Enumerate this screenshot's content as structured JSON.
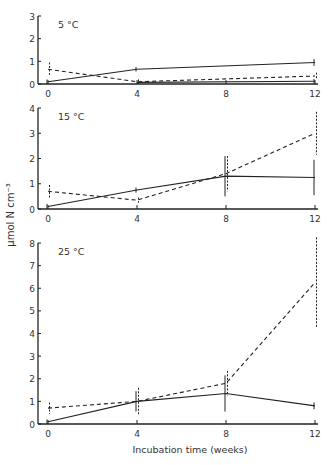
{
  "figure": {
    "ylabel": "µmol N cm⁻³",
    "xlabel": "Incubation time (weeks)"
  },
  "chart_data": [
    {
      "type": "line",
      "title": "5 °C",
      "xlabel": "Incubation time (weeks)",
      "ylabel": "µmol N cm⁻³",
      "x": [
        0,
        4,
        8,
        12
      ],
      "xticks": [
        0,
        4,
        8,
        12
      ],
      "yticks": [
        0,
        1,
        2,
        3
      ],
      "ylim": [
        0,
        3
      ],
      "xlim": [
        0,
        12
      ],
      "series": [
        {
          "name": "solid",
          "style": "solid",
          "x": [
            0,
            4,
            12
          ],
          "values": [
            0.1,
            0.65,
            0.95
          ],
          "err": [
            0.1,
            0.1,
            0.15
          ]
        },
        {
          "name": "dashed",
          "style": "dashed",
          "x": [
            0,
            4,
            12
          ],
          "values": [
            0.65,
            0.1,
            0.35
          ],
          "err": [
            0.3,
            0.1,
            0.15
          ]
        },
        {
          "name": "baseline-solid",
          "style": "solid",
          "x": [
            4,
            12
          ],
          "values": [
            0.07,
            0.12
          ],
          "err": [
            0,
            0.1
          ]
        }
      ]
    },
    {
      "type": "line",
      "title": "15 °C",
      "xlabel": "Incubation time (weeks)",
      "ylabel": "µmol N cm⁻³",
      "x": [
        0,
        4,
        8,
        12
      ],
      "xticks": [
        0,
        4,
        8,
        12
      ],
      "yticks": [
        0,
        1,
        2,
        3,
        4
      ],
      "ylim": [
        0,
        4
      ],
      "xlim": [
        0,
        12
      ],
      "series": [
        {
          "name": "solid",
          "style": "solid",
          "x": [
            0,
            4,
            8,
            12
          ],
          "values": [
            0.1,
            0.75,
            1.3,
            1.25
          ],
          "err": [
            0.1,
            0.1,
            0.8,
            0.7
          ]
        },
        {
          "name": "dashed",
          "style": "dashed",
          "x": [
            0,
            4,
            8,
            12
          ],
          "values": [
            0.7,
            0.35,
            1.4,
            3.0
          ],
          "err": [
            0.25,
            0.1,
            0.7,
            0.85
          ]
        }
      ]
    },
    {
      "type": "line",
      "title": "25 °C",
      "xlabel": "Incubation time (weeks)",
      "ylabel": "µmol N cm⁻³",
      "x": [
        0,
        4,
        8,
        12
      ],
      "xticks": [
        0,
        4,
        8,
        12
      ],
      "yticks": [
        0,
        1,
        2,
        3,
        4,
        5,
        6,
        7,
        8
      ],
      "ylim": [
        0,
        8
      ],
      "xlim": [
        0,
        12
      ],
      "series": [
        {
          "name": "solid",
          "style": "solid",
          "x": [
            0,
            4,
            8,
            12
          ],
          "values": [
            0.1,
            1.0,
            1.35,
            0.8
          ],
          "err": [
            0.1,
            0.45,
            0.8,
            0.15
          ]
        },
        {
          "name": "dashed",
          "style": "dashed",
          "x": [
            0,
            4,
            8,
            12
          ],
          "values": [
            0.7,
            1.0,
            1.8,
            6.25
          ],
          "err": [
            0.25,
            0.6,
            0.55,
            2.0
          ]
        }
      ]
    }
  ]
}
